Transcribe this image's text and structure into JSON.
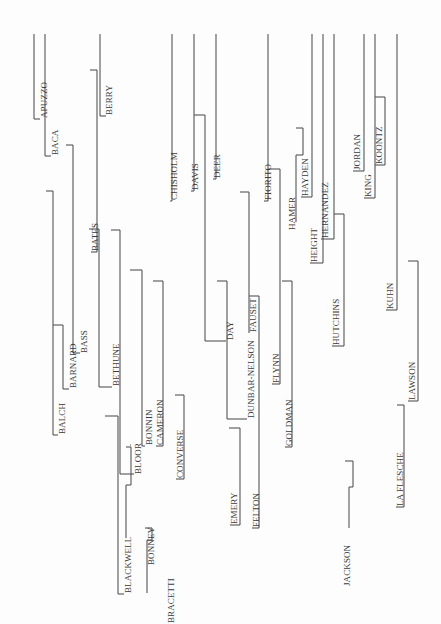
{
  "diagram": {
    "type": "rotated-bracket-tree",
    "orientation": "vertical-text-rotated-90-ccw",
    "line_color": "#555555",
    "text_color": "#3a3a3a",
    "names": [
      {
        "id": "apuzzo",
        "label": "APUZZO",
        "x": 44,
        "y": 118
      },
      {
        "id": "baca",
        "label": "BACA",
        "x": 55,
        "y": 155
      },
      {
        "id": "berry",
        "label": "BERRY",
        "x": 109,
        "y": 115
      },
      {
        "id": "balch",
        "label": "BALCH",
        "x": 62,
        "y": 434
      },
      {
        "id": "barnard",
        "label": "BARNARD",
        "x": 73,
        "y": 388
      },
      {
        "id": "bass",
        "label": "BASS",
        "x": 84,
        "y": 353
      },
      {
        "id": "bates",
        "label": "BATES",
        "x": 95,
        "y": 251
      },
      {
        "id": "bethune",
        "label": "BETHUNE",
        "x": 116,
        "y": 386
      },
      {
        "id": "blackwell",
        "label": "BLACKWELL",
        "x": 128,
        "y": 593
      },
      {
        "id": "bloor",
        "label": "BLOOR",
        "x": 138,
        "y": 474
      },
      {
        "id": "bonney",
        "label": "BONNEY",
        "x": 151,
        "y": 565
      },
      {
        "id": "bonnin",
        "label": "BONNIN",
        "x": 149,
        "y": 445
      },
      {
        "id": "bracetti",
        "label": "BRACETTI",
        "x": 171,
        "y": 623
      },
      {
        "id": "cameron",
        "label": "CAMERON",
        "x": 160,
        "y": 445
      },
      {
        "id": "chisholm",
        "label": "CHISHOLM",
        "x": 174,
        "y": 200
      },
      {
        "id": "converse",
        "label": "CONVERSE",
        "x": 180,
        "y": 478
      },
      {
        "id": "davis",
        "label": "DAVIS",
        "x": 195,
        "y": 190
      },
      {
        "id": "deer",
        "label": "DEER",
        "x": 217,
        "y": 178
      },
      {
        "id": "day",
        "label": "DAY",
        "x": 230,
        "y": 340
      },
      {
        "id": "dunbar-nelson",
        "label": "DUNBAR-NELSON",
        "x": 251,
        "y": 418
      },
      {
        "id": "emery",
        "label": "EMERY",
        "x": 234,
        "y": 524
      },
      {
        "id": "fauset",
        "label": "FAUSET",
        "x": 253,
        "y": 332
      },
      {
        "id": "felton",
        "label": "FELTON",
        "x": 256,
        "y": 527
      },
      {
        "id": "fiorito",
        "label": "FIORITO",
        "x": 268,
        "y": 200
      },
      {
        "id": "flynn",
        "label": "FLYNN",
        "x": 276,
        "y": 383
      },
      {
        "id": "goldman",
        "label": "GOLDMAN",
        "x": 289,
        "y": 446
      },
      {
        "id": "hamer",
        "label": "HAMER",
        "x": 292,
        "y": 230
      },
      {
        "id": "hayden",
        "label": "HAYDEN",
        "x": 305,
        "y": 196
      },
      {
        "id": "height",
        "label": "HEIGHT",
        "x": 314,
        "y": 262
      },
      {
        "id": "hernandez",
        "label": "HERNANDEZ",
        "x": 325,
        "y": 238
      },
      {
        "id": "hutchins",
        "label": "HUTCHINS",
        "x": 336,
        "y": 345
      },
      {
        "id": "jackson",
        "label": "JACKSON",
        "x": 347,
        "y": 586
      },
      {
        "id": "jordan",
        "label": "JORDAN",
        "x": 357,
        "y": 170
      },
      {
        "id": "king",
        "label": "KING",
        "x": 368,
        "y": 197
      },
      {
        "id": "koontz",
        "label": "KOONTZ",
        "x": 379,
        "y": 164
      },
      {
        "id": "kuhn",
        "label": "KUHN",
        "x": 390,
        "y": 309
      },
      {
        "id": "la-flesche",
        "label": "LA FLESCHE",
        "x": 400,
        "y": 506
      },
      {
        "id": "lawson",
        "label": "LAWSON",
        "x": 412,
        "y": 400
      }
    ],
    "segments": [
      [
        34,
        34,
        34,
        119
      ],
      [
        34,
        119,
        40,
        119
      ],
      [
        45,
        34,
        45,
        156
      ],
      [
        45,
        156,
        51,
        156
      ],
      [
        100,
        34,
        100,
        116
      ],
      [
        100,
        116,
        106,
        116
      ],
      [
        90,
        70,
        97,
        70
      ],
      [
        97,
        70,
        97,
        252
      ],
      [
        97,
        252,
        91,
        252
      ],
      [
        66,
        145,
        73,
        145
      ],
      [
        73,
        145,
        73,
        353
      ],
      [
        73,
        353,
        80,
        353
      ],
      [
        46,
        191,
        53,
        191
      ],
      [
        53,
        191,
        53,
        435
      ],
      [
        53,
        435,
        58,
        435
      ],
      [
        53,
        325,
        63,
        325
      ],
      [
        63,
        325,
        63,
        389
      ],
      [
        63,
        389,
        69,
        389
      ],
      [
        89,
        229,
        99,
        229
      ],
      [
        99,
        229,
        99,
        387
      ],
      [
        99,
        387,
        112,
        387
      ],
      [
        111,
        230,
        120,
        230
      ],
      [
        120,
        230,
        120,
        474
      ],
      [
        120,
        474,
        134,
        474
      ],
      [
        130,
        270,
        142,
        270
      ],
      [
        142,
        270,
        142,
        446
      ],
      [
        142,
        446,
        145,
        446
      ],
      [
        153,
        281,
        163,
        281
      ],
      [
        163,
        281,
        163,
        446
      ],
      [
        163,
        446,
        156,
        446
      ],
      [
        175,
        395,
        184,
        395
      ],
      [
        184,
        395,
        184,
        479
      ],
      [
        184,
        479,
        176,
        479
      ],
      [
        105,
        416,
        118,
        416
      ],
      [
        118,
        416,
        118,
        594
      ],
      [
        118,
        594,
        124,
        594
      ],
      [
        131,
        445,
        130,
        445
      ],
      [
        126,
        447,
        131,
        447
      ],
      [
        131,
        447,
        131,
        485
      ],
      [
        131,
        485,
        126,
        485
      ],
      [
        126,
        485,
        126,
        538
      ],
      [
        145,
        528,
        152,
        528
      ],
      [
        152,
        528,
        152,
        540
      ],
      [
        152,
        540,
        147,
        540
      ],
      [
        147,
        540,
        147,
        593
      ],
      [
        172,
        34,
        172,
        201
      ],
      [
        172,
        201,
        170,
        201
      ],
      [
        194,
        34,
        194,
        191
      ],
      [
        194,
        191,
        191,
        191
      ],
      [
        194,
        115,
        205,
        115
      ],
      [
        205,
        115,
        205,
        341
      ],
      [
        205,
        341,
        226,
        341
      ],
      [
        216,
        34,
        216,
        179
      ],
      [
        216,
        179,
        213,
        179
      ],
      [
        217,
        281,
        227,
        281
      ],
      [
        227,
        281,
        227,
        419
      ],
      [
        227,
        419,
        247,
        419
      ],
      [
        229,
        428,
        240,
        428
      ],
      [
        240,
        428,
        240,
        525
      ],
      [
        240,
        525,
        230,
        525
      ],
      [
        240,
        192,
        249,
        192
      ],
      [
        249,
        192,
        249,
        333
      ],
      [
        249,
        333,
        249,
        333
      ],
      [
        249,
        296,
        259,
        296
      ],
      [
        259,
        296,
        259,
        528
      ],
      [
        259,
        528,
        252,
        528
      ],
      [
        268,
        34,
        268,
        201
      ],
      [
        268,
        201,
        264,
        201
      ],
      [
        268,
        169,
        280,
        169
      ],
      [
        280,
        169,
        280,
        384
      ],
      [
        280,
        384,
        272,
        384
      ],
      [
        282,
        281,
        292,
        281
      ],
      [
        292,
        281,
        292,
        447
      ],
      [
        292,
        447,
        285,
        447
      ],
      [
        296,
        128,
        303,
        128
      ],
      [
        303,
        128,
        303,
        155
      ],
      [
        303,
        155,
        296,
        155
      ],
      [
        296,
        155,
        296,
        222
      ],
      [
        312,
        34,
        312,
        197
      ],
      [
        312,
        197,
        301,
        197
      ],
      [
        323,
        34,
        323,
        263
      ],
      [
        323,
        263,
        310,
        263
      ],
      [
        334,
        34,
        334,
        239
      ],
      [
        334,
        239,
        321,
        239
      ],
      [
        334,
        214,
        344,
        214
      ],
      [
        344,
        214,
        344,
        346
      ],
      [
        344,
        346,
        332,
        346
      ],
      [
        345,
        461,
        353,
        461
      ],
      [
        353,
        461,
        353,
        487
      ],
      [
        353,
        487,
        349,
        487
      ],
      [
        349,
        487,
        349,
        528
      ],
      [
        364,
        34,
        364,
        171
      ],
      [
        364,
        171,
        353,
        171
      ],
      [
        375,
        34,
        375,
        198
      ],
      [
        375,
        198,
        364,
        198
      ],
      [
        375,
        97,
        385,
        97
      ],
      [
        385,
        97,
        385,
        165
      ],
      [
        385,
        165,
        375,
        165
      ],
      [
        397,
        34,
        397,
        310
      ],
      [
        397,
        310,
        386,
        310
      ],
      [
        408,
        261,
        418,
        261
      ],
      [
        418,
        261,
        418,
        401
      ],
      [
        418,
        401,
        408,
        401
      ],
      [
        397,
        405,
        404,
        405
      ],
      [
        404,
        405,
        404,
        507
      ],
      [
        404,
        507,
        396,
        507
      ]
    ]
  }
}
